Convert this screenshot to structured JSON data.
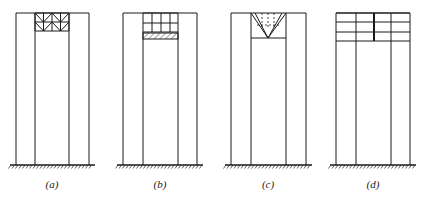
{
  "figure": {
    "stroke_color": "#1a1a1a",
    "ground_y": 165,
    "top_y": 13,
    "label_y": 178,
    "panels": [
      {
        "id": "a",
        "label": "(a)",
        "label_x": 52,
        "columns_x": [
          16,
          35,
          69,
          89
        ],
        "type": "truss-top",
        "core": {
          "x0": 35,
          "x1": 69,
          "rows_y": [
            13,
            22,
            31
          ],
          "panels": 2
        }
      },
      {
        "id": "b",
        "label": "(b)",
        "label_x": 160,
        "columns_x": [
          123,
          143,
          178,
          197
        ],
        "type": "grid-with-hatched-beam",
        "core": {
          "x0": 143,
          "x1": 178,
          "rows_y": [
            13,
            23,
            32
          ],
          "verticals_x": [
            152,
            161,
            170
          ],
          "beam_y": [
            33,
            39
          ]
        }
      },
      {
        "id": "c",
        "label": "(c)",
        "label_x": 268,
        "columns_x": [
          231,
          251,
          286,
          306
        ],
        "type": "v-brace-top",
        "core": {
          "x0": 251,
          "x1": 286,
          "bottom_y": 38,
          "apex_x": 268,
          "dash_verticals_x": [
            262,
            268,
            274
          ],
          "dash_row_y": 25
        }
      },
      {
        "id": "d",
        "label": "(d)",
        "label_x": 373,
        "columns_x": [
          336,
          356,
          391,
          410
        ],
        "type": "multi-storey-grid",
        "core": {
          "rows_y": [
            13,
            22,
            32,
            41
          ],
          "center_x": 374
        }
      }
    ]
  }
}
